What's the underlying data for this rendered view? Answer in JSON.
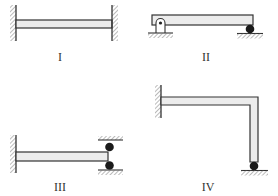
{
  "diagram": {
    "type": "beam support configurations",
    "colors": {
      "line": "#333333",
      "beam_fill": "#ececec",
      "hatch": "#777777",
      "ball": "#1a1a1a"
    },
    "panels": [
      {
        "id": "I",
        "label": "I",
        "description": "Beam fixed at both ends (two walls)"
      },
      {
        "id": "II",
        "label": "II",
        "description": "Beam on pin support (left) and roller (right)"
      },
      {
        "id": "III",
        "label": "III",
        "description": "Beam fixed at left wall, right end between two rollers held by top and bottom plates"
      },
      {
        "id": "IV",
        "label": "IV",
        "description": "L-shaped frame fixed at left wall, vertical leg resting on roller on ground"
      }
    ]
  }
}
